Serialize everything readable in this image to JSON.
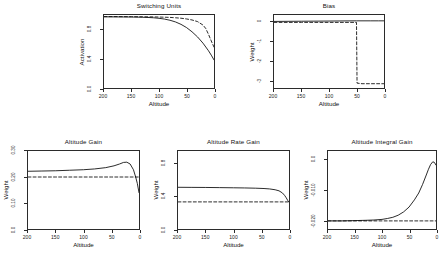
{
  "figure": {
    "background_color": "#ffffff",
    "line_color": "#000000",
    "panel_count": 5
  },
  "chart_data": [
    {
      "type": "line",
      "title": "Switching Units",
      "xlabel": "Altitude",
      "ylabel": "Activation",
      "xlim": [
        200,
        0
      ],
      "ylim": [
        0.0,
        1.0
      ],
      "xticks": [
        "200",
        "150",
        "100",
        "50",
        "0"
      ],
      "xtick_values": [
        200,
        150,
        100,
        50,
        0
      ],
      "yticks": [
        "0.0",
        "0.4",
        "0.8"
      ],
      "ytick_values": [
        0.0,
        0.4,
        0.8
      ],
      "grid": false,
      "legend": "none",
      "series": [
        {
          "name": "unit-1",
          "style": "solid",
          "x": [
            200,
            180,
            160,
            150,
            140,
            130,
            120,
            110,
            100,
            90,
            80,
            70,
            60,
            50,
            40,
            30,
            20,
            10,
            5,
            0
          ],
          "values": [
            0.975,
            0.974,
            0.973,
            0.972,
            0.971,
            0.969,
            0.966,
            0.962,
            0.955,
            0.944,
            0.928,
            0.905,
            0.872,
            0.828,
            0.77,
            0.7,
            0.614,
            0.51,
            0.45,
            0.385
          ]
        },
        {
          "name": "unit-2",
          "style": "dashed",
          "x": [
            200,
            180,
            160,
            150,
            140,
            130,
            120,
            110,
            100,
            90,
            80,
            70,
            60,
            50,
            40,
            30,
            20,
            15,
            10,
            5,
            0
          ],
          "values": [
            0.978,
            0.978,
            0.977,
            0.977,
            0.976,
            0.976,
            0.975,
            0.974,
            0.972,
            0.97,
            0.967,
            0.962,
            0.956,
            0.946,
            0.932,
            0.91,
            0.862,
            0.815,
            0.735,
            0.645,
            0.56
          ]
        }
      ]
    },
    {
      "type": "line",
      "title": "Bias",
      "xlabel": "Altitude",
      "ylabel": "Weight",
      "xlim": [
        200,
        0
      ],
      "ylim": [
        -3.4,
        0.35
      ],
      "xticks": [
        "200",
        "150",
        "100",
        "50",
        "0"
      ],
      "xtick_values": [
        200,
        150,
        100,
        50,
        0
      ],
      "yticks": [
        "0",
        "-1",
        "-2",
        "-3"
      ],
      "ytick_values": [
        0,
        -1,
        -2,
        -3
      ],
      "grid": false,
      "legend": "none",
      "series": [
        {
          "name": "bias-solid",
          "style": "solid",
          "x": [
            200,
            150,
            100,
            50,
            25,
            10,
            0
          ],
          "values": [
            0.02,
            0.03,
            0.04,
            0.05,
            0.05,
            0.05,
            0.05
          ]
        },
        {
          "name": "bias-dashed",
          "style": "dashed",
          "x": [
            200,
            150,
            100,
            60,
            52,
            50,
            49,
            40,
            20,
            0
          ],
          "values": [
            -0.03,
            -0.03,
            -0.03,
            -0.03,
            -0.03,
            -0.03,
            -3.15,
            -3.18,
            -3.18,
            -3.18
          ]
        }
      ]
    },
    {
      "type": "line",
      "title": "Altitude Gain",
      "xlabel": "Altitude",
      "ylabel": "Weight",
      "xlim": [
        200,
        0
      ],
      "ylim": [
        0.0,
        0.3
      ],
      "xticks": [
        "200",
        "150",
        "100",
        "50",
        "0"
      ],
      "xtick_values": [
        200,
        150,
        100,
        50,
        0
      ],
      "yticks": [
        "0.0",
        "0.10",
        "0.20",
        "0.30"
      ],
      "ytick_values": [
        0.0,
        0.1,
        0.2,
        0.3
      ],
      "grid": false,
      "legend": "none",
      "series": [
        {
          "name": "gain-solid",
          "style": "solid",
          "x": [
            200,
            175,
            150,
            125,
            100,
            80,
            60,
            45,
            35,
            28,
            22,
            16,
            10,
            6,
            3,
            0
          ],
          "values": [
            0.222,
            0.223,
            0.224,
            0.226,
            0.228,
            0.231,
            0.236,
            0.243,
            0.25,
            0.256,
            0.257,
            0.25,
            0.228,
            0.2,
            0.175,
            0.14
          ]
        },
        {
          "name": "gain-dashed",
          "style": "dashed",
          "x": [
            200,
            150,
            100,
            50,
            20,
            0
          ],
          "values": [
            0.2,
            0.2,
            0.2,
            0.2,
            0.2,
            0.2
          ]
        }
      ]
    },
    {
      "type": "line",
      "title": "Altitude Rate Gain",
      "xlabel": "Altitude",
      "ylabel": "Weight",
      "xlim": [
        200,
        0
      ],
      "ylim": [
        0.0,
        0.95
      ],
      "xticks": [
        "200",
        "150",
        "100",
        "50",
        "0"
      ],
      "xtick_values": [
        200,
        150,
        100,
        50,
        0
      ],
      "yticks": [
        "0.0",
        "0.4",
        "0.8"
      ],
      "ytick_values": [
        0.0,
        0.4,
        0.8
      ],
      "grid": false,
      "legend": "none",
      "series": [
        {
          "name": "rate-gain-solid",
          "style": "solid",
          "x": [
            200,
            175,
            150,
            125,
            100,
            80,
            60,
            45,
            35,
            25,
            18,
            12,
            8,
            5,
            2,
            0
          ],
          "values": [
            0.508,
            0.507,
            0.506,
            0.504,
            0.502,
            0.5,
            0.497,
            0.493,
            0.488,
            0.478,
            0.465,
            0.44,
            0.41,
            0.38,
            0.345,
            0.33
          ]
        },
        {
          "name": "rate-gain-dashed",
          "style": "dashed",
          "x": [
            200,
            150,
            100,
            50,
            20,
            0
          ],
          "values": [
            0.33,
            0.33,
            0.33,
            0.33,
            0.33,
            0.33
          ]
        }
      ]
    },
    {
      "type": "line",
      "title": "Altitude Integral Gain",
      "xlabel": "Altitude",
      "ylabel": "Weight",
      "xlim": [
        200,
        0
      ],
      "ylim": [
        -0.023,
        0.003
      ],
      "xticks": [
        "200",
        "150",
        "100",
        "50",
        "0"
      ],
      "xtick_values": [
        200,
        150,
        100,
        50,
        0
      ],
      "yticks": [
        "0.0",
        "-0.010",
        "-0.020"
      ],
      "ytick_values": [
        0.0,
        -0.01,
        -0.02
      ],
      "grid": false,
      "legend": "none",
      "series": [
        {
          "name": "integral-gain-solid",
          "style": "solid",
          "x": [
            200,
            175,
            150,
            130,
            115,
            100,
            90,
            80,
            70,
            60,
            50,
            40,
            32,
            25,
            18,
            14,
            10,
            6,
            3,
            0
          ],
          "values": [
            -0.0203,
            -0.0203,
            -0.0202,
            -0.0201,
            -0.02,
            -0.0198,
            -0.0195,
            -0.0191,
            -0.0184,
            -0.0173,
            -0.0157,
            -0.0133,
            -0.011,
            -0.0082,
            -0.005,
            -0.0031,
            -0.0015,
            -0.0006,
            -0.0008,
            -0.0017
          ]
        },
        {
          "name": "integral-gain-dashed",
          "style": "dashed",
          "x": [
            200,
            150,
            100,
            50,
            20,
            0
          ],
          "values": [
            -0.0203,
            -0.0203,
            -0.0203,
            -0.0203,
            -0.0203,
            -0.0203
          ]
        }
      ]
    }
  ]
}
